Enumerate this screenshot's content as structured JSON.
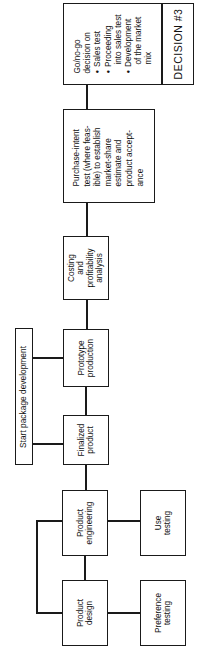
{
  "diagram": {
    "orientation": "rotated-90-ccw",
    "nodes": {
      "decision": {
        "heading": [
          "Go/no-go",
          "decision on"
        ],
        "bullets": [
          [
            "Sales test"
          ],
          [
            "Proceeding",
            "into sales test"
          ],
          [
            "Development",
            "of the market",
            "mix"
          ]
        ],
        "label": "DECISION #3"
      },
      "purchase_intent": {
        "lines": [
          "Purchase-intent",
          "test (where feas-",
          "ible) to establish",
          "market-share",
          "estimate and",
          "product accept-",
          "ance"
        ]
      },
      "costing": {
        "lines": [
          "Costing",
          "and",
          "profitability",
          "analysis"
        ]
      },
      "prototype": {
        "lines": [
          "Prototype",
          "production"
        ]
      },
      "start_package": {
        "label": "Start package development"
      },
      "finalized": {
        "lines": [
          "Finalized",
          "product"
        ]
      },
      "product_engineering": {
        "lines": [
          "Product",
          "engineering"
        ]
      },
      "use_testing": {
        "lines": [
          "Use",
          "testing"
        ]
      },
      "product_design": {
        "lines": [
          "Product",
          "design"
        ]
      },
      "preference_testing": {
        "lines": [
          "Preference",
          "testing"
        ]
      }
    },
    "edges": [
      [
        "product_design",
        "product_engineering"
      ],
      [
        "product_design",
        "preference_testing"
      ],
      [
        "product_engineering",
        "use_testing"
      ],
      [
        "product_design",
        "product_engineering",
        "feedback-loop"
      ],
      [
        "product_engineering",
        "finalized"
      ],
      [
        "finalized",
        "start_package"
      ],
      [
        "finalized",
        "prototype"
      ],
      [
        "prototype",
        "start_package"
      ],
      [
        "prototype",
        "costing"
      ],
      [
        "costing",
        "purchase_intent"
      ],
      [
        "purchase_intent",
        "decision"
      ]
    ],
    "colors": {
      "line": "#1a1a1a",
      "background": "#ffffff"
    }
  }
}
